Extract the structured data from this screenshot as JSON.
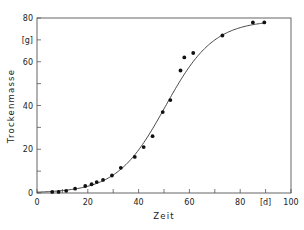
{
  "chart_data": {
    "type": "scatter",
    "title": "",
    "xlabel": "Zeit",
    "ylabel": "Trockenmasse",
    "x_unit": "[d]",
    "y_unit": "[g]",
    "xlim": [
      0,
      100
    ],
    "ylim": [
      0,
      80
    ],
    "x_ticks": [
      0,
      10,
      20,
      30,
      40,
      50,
      60,
      70,
      80,
      90,
      100
    ],
    "x_tick_labels": [
      {
        "value": 0,
        "label": "0"
      },
      {
        "value": 20,
        "label": "20"
      },
      {
        "value": 40,
        "label": "40"
      },
      {
        "value": 60,
        "label": "60"
      },
      {
        "value": 80,
        "label": "80"
      },
      {
        "value": 90,
        "label": "[d]"
      },
      {
        "value": 100,
        "label": "100"
      }
    ],
    "y_ticks": [
      0,
      10,
      20,
      30,
      40,
      50,
      60,
      70,
      80
    ],
    "y_tick_labels": [
      {
        "value": 0,
        "label": "0"
      },
      {
        "value": 20,
        "label": "20"
      },
      {
        "value": 40,
        "label": "40"
      },
      {
        "value": 60,
        "label": "60"
      },
      {
        "value": 70,
        "label": "[g]"
      },
      {
        "value": 80,
        "label": "80"
      }
    ],
    "grid": false,
    "legend": null,
    "series": [
      {
        "name": "Messwerte",
        "kind": "points",
        "x": [
          6,
          8.5,
          11.5,
          15,
          19,
          21.5,
          23.5,
          26,
          29.5,
          33,
          38.5,
          42,
          45.5,
          49.5,
          52.5,
          56.5,
          58,
          61.5,
          73,
          85,
          89.5
        ],
        "y": [
          0.5,
          0.5,
          1,
          2,
          3.2,
          4,
          5,
          6,
          8,
          11.5,
          16.5,
          21,
          26,
          37,
          42.5,
          56,
          62,
          64,
          72,
          78,
          78
        ]
      },
      {
        "name": "Logistische Kurve",
        "kind": "curve",
        "model": "logistic",
        "K": 79,
        "r": 0.105,
        "x0": 50.5,
        "x_range": [
          0,
          90
        ]
      }
    ]
  },
  "labels": {
    "xlabel": "Zeit",
    "ylabel": "Trockenmasse"
  }
}
